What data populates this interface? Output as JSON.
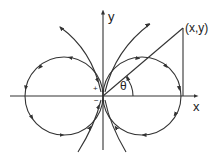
{
  "diagram": {
    "type": "dipole field lines",
    "axes": {
      "x_label": "x",
      "y_label": "y"
    },
    "point_label": "(x,y)",
    "angle_label": "θ",
    "pole_labels": {
      "positive": "+",
      "negative": "−"
    },
    "colors": {
      "line": "#333333",
      "background": "#ffffff"
    }
  }
}
